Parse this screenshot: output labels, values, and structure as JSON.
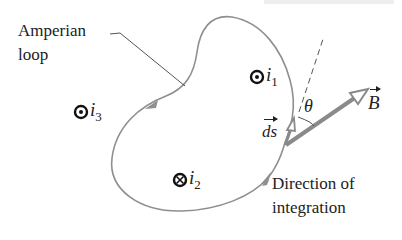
{
  "figure": {
    "loop_label": {
      "line1": "Amperian",
      "line2": "loop"
    },
    "currents": [
      {
        "name": "i",
        "subscript": "1",
        "direction": "out-of-page"
      },
      {
        "name": "i",
        "subscript": "2",
        "direction": "into-page"
      },
      {
        "name": "i",
        "subscript": "3",
        "direction": "out-of-page"
      }
    ],
    "vectors": {
      "ds": "ds",
      "B": "B"
    },
    "angle_label": "θ",
    "direction_label": {
      "line1": "Direction of",
      "line2": "integration"
    },
    "colors": {
      "loop": "#8f8f8f",
      "vector": "#8a8a8a",
      "text": "#222222"
    }
  }
}
